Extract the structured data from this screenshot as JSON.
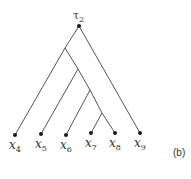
{
  "diagram": {
    "type": "binary-tree",
    "root": {
      "id": "root",
      "label_base": "τ",
      "label_sub": "2"
    },
    "leaves": [
      {
        "id": "x4",
        "base": "x",
        "sub": "4"
      },
      {
        "id": "x5",
        "base": "x",
        "sub": "5"
      },
      {
        "id": "x6",
        "base": "x",
        "sub": "6"
      },
      {
        "id": "x7",
        "base": "x",
        "sub": "7"
      },
      {
        "id": "x8",
        "base": "x",
        "sub": "8"
      },
      {
        "id": "x9",
        "base": "x",
        "sub": "9"
      }
    ],
    "internal_nodes": [
      "n1",
      "n2",
      "n3",
      "n4"
    ],
    "edges": [
      [
        "root",
        "n1"
      ],
      [
        "root",
        "x9"
      ],
      [
        "n1",
        "x4"
      ],
      [
        "n1",
        "n2"
      ],
      [
        "n2",
        "x5"
      ],
      [
        "n2",
        "n3"
      ],
      [
        "n3",
        "x6"
      ],
      [
        "n3",
        "n4"
      ],
      [
        "n4",
        "x7"
      ],
      [
        "n4",
        "x8"
      ]
    ],
    "panel_label": "(b)"
  },
  "colors": {
    "edge": "#555555",
    "node": "#1a1a1a",
    "text": "#333333"
  }
}
